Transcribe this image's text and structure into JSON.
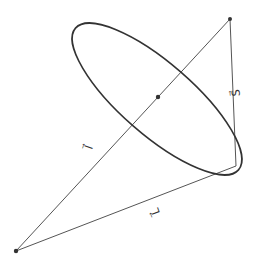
{
  "diagram": {
    "type": "vector-diagram",
    "colors": {
      "line": "#555555",
      "ellipse": "#333333",
      "point": "#333333",
      "label": "#333333"
    },
    "points": {
      "origin": {
        "x": 16,
        "y": 251
      },
      "apex": {
        "x": 230,
        "y": 19
      },
      "center": {
        "x": 158,
        "y": 97
      },
      "ellipse_tip": {
        "x": 236,
        "y": 166
      }
    },
    "ellipse": {
      "cx": 157,
      "cy": 99,
      "rx": 108,
      "ry": 36,
      "rotation_deg": 41
    },
    "labels": {
      "l_vector": "l⃗",
      "L_vector": "L⃗",
      "S_vector": "S⃗"
    }
  }
}
